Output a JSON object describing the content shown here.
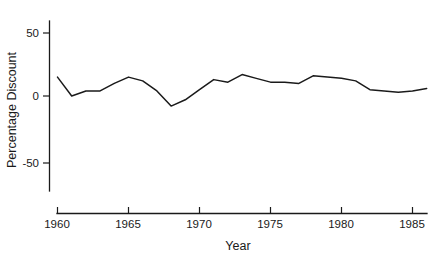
{
  "chart_data": {
    "type": "line",
    "title": "",
    "xlabel": "Year",
    "ylabel": "Percentage Discount",
    "xlim": [
      1960,
      1986
    ],
    "ylim": [
      -75,
      62
    ],
    "grid": false,
    "legend": null,
    "xticks": [
      1960,
      1965,
      1970,
      1975,
      1980,
      1985
    ],
    "xtick_labels": [
      "1960",
      "1965",
      "1970",
      "1975",
      "1980",
      "1985"
    ],
    "yticks": [
      50,
      0,
      -50
    ],
    "ytick_labels": [
      "50",
      "0",
      "-50"
    ],
    "x": [
      1960,
      1961,
      1962,
      1963,
      1964,
      1965,
      1966,
      1967,
      1968,
      1969,
      1970,
      1971,
      1972,
      1973,
      1974,
      1975,
      1976,
      1977,
      1978,
      1979,
      1980,
      1981,
      1982,
      1983,
      1984,
      1985,
      1986
    ],
    "values": [
      15,
      0,
      4,
      4,
      10,
      15,
      12,
      4,
      -8,
      -3,
      5,
      13,
      11,
      17,
      14,
      11,
      11,
      10,
      16,
      15,
      14,
      12,
      5,
      4,
      3,
      4,
      6
    ],
    "series": [
      {
        "name": "Percentage Discount",
        "values": [
          15,
          0,
          4,
          4,
          10,
          15,
          12,
          4,
          -8,
          -3,
          5,
          13,
          11,
          17,
          14,
          11,
          11,
          10,
          16,
          15,
          14,
          12,
          5,
          4,
          3,
          4,
          6
        ]
      }
    ],
    "line_color": "#1a1a1a"
  },
  "axes": {
    "y_title": "Percentage Discount",
    "x_title": "Year",
    "y_tick_0": "50",
    "y_tick_1": "0",
    "y_tick_2": "-50",
    "x_tick_0": "1960",
    "x_tick_1": "1965",
    "x_tick_2": "1970",
    "x_tick_3": "1975",
    "x_tick_4": "1980",
    "x_tick_5": "1985"
  }
}
